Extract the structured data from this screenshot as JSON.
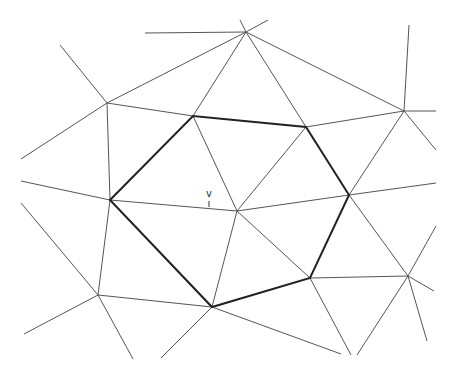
{
  "diagram": {
    "type": "triangulation-mesh",
    "vertex_label": "v",
    "center_vertex": [
      237,
      211
    ],
    "label_position": [
      206,
      188
    ],
    "colors": {
      "thin": "#555555",
      "thick": "#222222"
    },
    "hexagon": [
      [
        110,
        200
      ],
      [
        193,
        116
      ],
      [
        306,
        127
      ],
      [
        349,
        195
      ],
      [
        310,
        278
      ],
      [
        212,
        307
      ]
    ],
    "edges": [
      [
        [
          145,
          33
        ],
        [
          246,
          32
        ]
      ],
      [
        [
          246,
          32
        ],
        [
          268,
          20
        ]
      ],
      [
        [
          246,
          32
        ],
        [
          240,
          20
        ]
      ],
      [
        [
          246,
          32
        ],
        [
          107,
          103
        ]
      ],
      [
        [
          246,
          32
        ],
        [
          193,
          116
        ]
      ],
      [
        [
          246,
          32
        ],
        [
          306,
          127
        ]
      ],
      [
        [
          246,
          32
        ],
        [
          404,
          111
        ]
      ],
      [
        [
          107,
          103
        ],
        [
          60,
          45
        ]
      ],
      [
        [
          107,
          103
        ],
        [
          21,
          159
        ]
      ],
      [
        [
          107,
          103
        ],
        [
          193,
          116
        ]
      ],
      [
        [
          107,
          103
        ],
        [
          110,
          200
        ]
      ],
      [
        [
          404,
          111
        ],
        [
          409,
          25
        ]
      ],
      [
        [
          404,
          111
        ],
        [
          436,
          111
        ]
      ],
      [
        [
          404,
          111
        ],
        [
          306,
          127
        ]
      ],
      [
        [
          404,
          111
        ],
        [
          349,
          195
        ]
      ],
      [
        [
          404,
          111
        ],
        [
          436,
          150
        ]
      ],
      [
        [
          110,
          200
        ],
        [
          21,
          181
        ]
      ],
      [
        [
          110,
          200
        ],
        [
          237,
          211
        ]
      ],
      [
        [
          110,
          200
        ],
        [
          98,
          295
        ]
      ],
      [
        [
          193,
          116
        ],
        [
          237,
          211
        ]
      ],
      [
        [
          306,
          127
        ],
        [
          237,
          211
        ]
      ],
      [
        [
          349,
          195
        ],
        [
          237,
          211
        ]
      ],
      [
        [
          310,
          278
        ],
        [
          237,
          211
        ]
      ],
      [
        [
          212,
          307
        ],
        [
          237,
          211
        ]
      ],
      [
        [
          349,
          195
        ],
        [
          436,
          183
        ]
      ],
      [
        [
          349,
          195
        ],
        [
          408,
          276
        ]
      ],
      [
        [
          21,
          203
        ],
        [
          98,
          295
        ]
      ],
      [
        [
          98,
          295
        ],
        [
          24,
          334
        ]
      ],
      [
        [
          98,
          295
        ],
        [
          133,
          359
        ]
      ],
      [
        [
          98,
          295
        ],
        [
          212,
          307
        ]
      ],
      [
        [
          212,
          307
        ],
        [
          161,
          358
        ]
      ],
      [
        [
          212,
          307
        ],
        [
          341,
          354
        ]
      ],
      [
        [
          310,
          278
        ],
        [
          351,
          355
        ]
      ],
      [
        [
          310,
          278
        ],
        [
          408,
          276
        ]
      ],
      [
        [
          408,
          276
        ],
        [
          436,
          226
        ]
      ],
      [
        [
          408,
          276
        ],
        [
          434,
          291
        ]
      ],
      [
        [
          408,
          276
        ],
        [
          427,
          341
        ]
      ],
      [
        [
          408,
          276
        ],
        [
          357,
          355
        ]
      ]
    ]
  }
}
